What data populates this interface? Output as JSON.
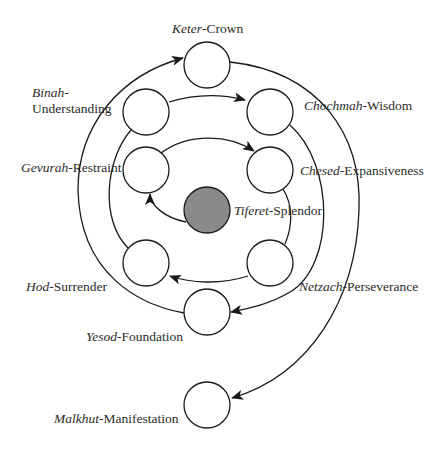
{
  "diagram": {
    "colors": {
      "stroke": "#1a1a1a",
      "node_fill": "#ffffff",
      "center_fill": "#8a8a8a",
      "text": "#2b2b2b"
    },
    "nodes": [
      {
        "id": "keter",
        "hebrew": "Keter",
        "sep": "-",
        "english": "Crown",
        "cx": 207,
        "cy": 65,
        "center": false
      },
      {
        "id": "binah",
        "hebrew": "Binah",
        "sep": "-",
        "english": "Understanding",
        "cx": 146,
        "cy": 112,
        "center": false
      },
      {
        "id": "chochmah",
        "hebrew": "Chochmah",
        "sep": "-",
        "english": "Wisdom",
        "cx": 270,
        "cy": 112,
        "center": false
      },
      {
        "id": "gevurah",
        "hebrew": "Gevurah",
        "sep": "-",
        "english": "Restraint",
        "cx": 146,
        "cy": 170,
        "center": false
      },
      {
        "id": "chesed",
        "hebrew": "Chesed",
        "sep": "-",
        "english": "Expansiveness",
        "cx": 270,
        "cy": 170,
        "center": false
      },
      {
        "id": "tiferet",
        "hebrew": "Tiferet",
        "sep": "-",
        "english": "Splendor",
        "cx": 207,
        "cy": 210,
        "center": true
      },
      {
        "id": "hod",
        "hebrew": "Hod",
        "sep": "-",
        "english": "Surrender",
        "cx": 146,
        "cy": 263,
        "center": false
      },
      {
        "id": "netzach",
        "hebrew": "Netzach",
        "sep": "-",
        "english": "Perseverance",
        "cx": 270,
        "cy": 263,
        "center": false
      },
      {
        "id": "yesod",
        "hebrew": "Yesod",
        "sep": "-",
        "english": "Foundation",
        "cx": 207,
        "cy": 312,
        "center": false
      },
      {
        "id": "malkhut",
        "hebrew": "Malkhut",
        "sep": "-",
        "english": "Manifestation",
        "cx": 207,
        "cy": 405,
        "center": false
      }
    ],
    "labels": {
      "keter": {
        "hebrew": "Keter",
        "english": "Crown"
      },
      "binah": {
        "hebrew": "Binah",
        "english": "Understanding"
      },
      "chochmah": {
        "hebrew": "Chochmah",
        "english": "Wisdom"
      },
      "gevurah": {
        "hebrew": "Gevurah",
        "english": "Restraint"
      },
      "chesed": {
        "hebrew": "Chesed",
        "english": "Expansiveness"
      },
      "tiferet": {
        "hebrew": "Tiferet",
        "english": "Splendor"
      },
      "hod": {
        "hebrew": "Hod",
        "english": "Surrender"
      },
      "netzach": {
        "hebrew": "Netzach",
        "english": "Perseverance"
      },
      "yesod": {
        "hebrew": "Yesod",
        "english": "Foundation"
      },
      "malkhut": {
        "hebrew": "Malkhut",
        "english": "Manifestation"
      }
    },
    "edges": [
      {
        "from": "tiferet",
        "to": "gevurah",
        "arrow": true
      },
      {
        "from": "gevurah",
        "to": "chesed",
        "arrow": true
      },
      {
        "from": "chesed",
        "to": "netzach",
        "arrow": false
      },
      {
        "from": "netzach",
        "to": "hod",
        "arrow": true
      },
      {
        "from": "hod",
        "to": "binah",
        "arrow": false
      },
      {
        "from": "binah",
        "to": "chochmah",
        "arrow": true
      },
      {
        "from": "chochmah",
        "to": "yesod",
        "arrow": true
      },
      {
        "from": "yesod",
        "to": "keter",
        "arrow": true
      },
      {
        "from": "keter",
        "to": "malkhut",
        "arrow": true
      }
    ]
  }
}
